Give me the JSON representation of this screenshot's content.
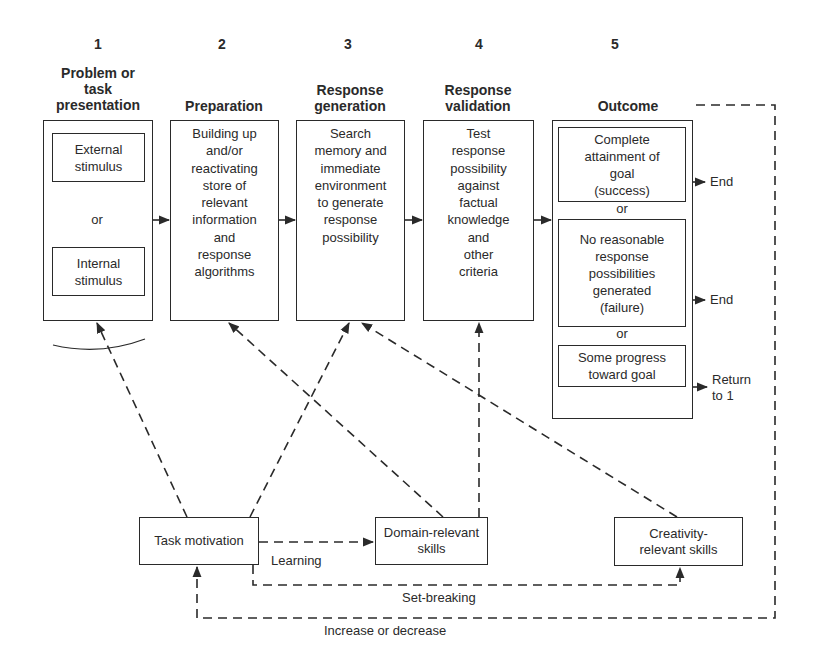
{
  "stages": [
    {
      "number": "1",
      "title": "Problem or\ntask\npresentation"
    },
    {
      "number": "2",
      "title": "Preparation",
      "body": "Building up\nand/or\nreactivating\nstore of\nrelevant\ninformation\nand\nresponse\nalgorithms"
    },
    {
      "number": "3",
      "title": "Response\ngeneration",
      "body": "Search\nmemory and\nimmediate\nenvironment\nto generate\nresponse\npossibility"
    },
    {
      "number": "4",
      "title": "Response\nvalidation",
      "body": "Test\nresponse\npossibility\nagainst\nfactual\nknowledge\nand\nother\ncriteria"
    },
    {
      "number": "5",
      "title": "Outcome"
    }
  ],
  "stage1": {
    "external": "External\nstimulus",
    "or": "or",
    "internal": "Internal\nstimulus"
  },
  "outcome": {
    "success": "Complete\nattainment of\ngoal\n(success)",
    "or1": "or",
    "failure": "No reasonable\nresponse\npossibilities\ngenerated\n(failure)",
    "or2": "or",
    "progress": "Some progress\ntoward goal",
    "end1": "End",
    "end2": "End",
    "return": "Return\nto 1"
  },
  "components": {
    "task_motivation": "Task motivation",
    "domain_skills": "Domain-relevant\nskills",
    "creativity_skills": "Creativity-\nrelevant skills"
  },
  "links": {
    "learning": "Learning",
    "set_breaking": "Set-breaking",
    "increase_decrease": "Increase or decrease"
  },
  "colors": {
    "ink": "#2a2a2a",
    "background": "#ffffff"
  }
}
